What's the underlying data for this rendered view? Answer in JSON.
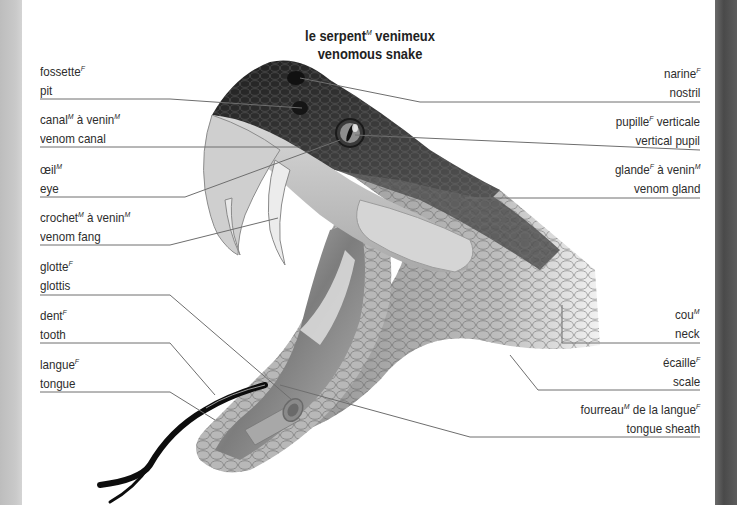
{
  "title": {
    "fr_main": "le serpent",
    "fr_main_gender": "M",
    "fr_rest": " venimeux",
    "en": "venomous snake"
  },
  "labels_left": [
    {
      "fr": "fossette",
      "fr_gender": "F",
      "fr_rest": "",
      "fr_rest_gender": "",
      "en": "pit"
    },
    {
      "fr": "canal",
      "fr_gender": "M",
      "fr_rest": " à venin",
      "fr_rest_gender": "M",
      "en": "venom canal"
    },
    {
      "fr": "œil",
      "fr_gender": "M",
      "fr_rest": "",
      "fr_rest_gender": "",
      "en": "eye"
    },
    {
      "fr": "crochet",
      "fr_gender": "M",
      "fr_rest": " à venin",
      "fr_rest_gender": "M",
      "en": "venom fang"
    },
    {
      "fr": "glotte",
      "fr_gender": "F",
      "fr_rest": "",
      "fr_rest_gender": "",
      "en": "glottis"
    },
    {
      "fr": "dent",
      "fr_gender": "F",
      "fr_rest": "",
      "fr_rest_gender": "",
      "en": "tooth"
    },
    {
      "fr": "langue",
      "fr_gender": "F",
      "fr_rest": "",
      "fr_rest_gender": "",
      "en": "tongue"
    }
  ],
  "labels_right": [
    {
      "fr": "narine",
      "fr_gender": "F",
      "fr_rest": "",
      "fr_rest_gender": "",
      "en": "nostril"
    },
    {
      "fr": "pupille",
      "fr_gender": "F",
      "fr_rest": " verticale",
      "fr_rest_gender": "",
      "en": "vertical pupil"
    },
    {
      "fr": "glande",
      "fr_gender": "F",
      "fr_rest": " à venin",
      "fr_rest_gender": "M",
      "en": "venom gland"
    },
    {
      "fr": "cou",
      "fr_gender": "M",
      "fr_rest": "",
      "fr_rest_gender": "",
      "en": "neck"
    },
    {
      "fr": "écaille",
      "fr_gender": "F",
      "fr_rest": "",
      "fr_rest_gender": "",
      "en": "scale"
    },
    {
      "fr": "fourreau",
      "fr_gender": "M",
      "fr_rest": " de la langue",
      "fr_rest_gender": "F",
      "en": "tongue sheath"
    }
  ],
  "colors": {
    "leader_line": "#6e6e6e",
    "head_dark": "#2e2e2e",
    "scale_mid": "#8a8a8a",
    "scale_light": "#c8c8c8",
    "mouth_interior": "#9a9a9a",
    "tongue": "#111111",
    "page_edge_left": "#c4c4c4",
    "page_edge_right": "#555555"
  }
}
